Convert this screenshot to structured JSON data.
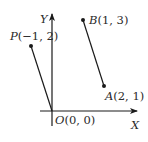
{
  "diagram": {
    "axes": {
      "x_label": "X",
      "y_label": "Y",
      "origin_label": "O(0, 0)"
    },
    "points": [
      {
        "name": "P",
        "coords_text": "(−1, 2)",
        "x": -1,
        "y": 2
      },
      {
        "name": "B",
        "coords_text": "(1, 3)",
        "x": 1,
        "y": 3
      },
      {
        "name": "A",
        "coords_text": "(2, 1)",
        "x": 2,
        "y": 1
      },
      {
        "name": "O",
        "coords_text": "(0, 0)",
        "x": 0,
        "y": 0
      }
    ],
    "segments": [
      {
        "from": "O",
        "to": "P"
      },
      {
        "from": "A",
        "to": "B"
      }
    ],
    "colors": {
      "line": "#1a1a1a",
      "text": "#2a2a2a",
      "background": "#ffffff"
    }
  }
}
